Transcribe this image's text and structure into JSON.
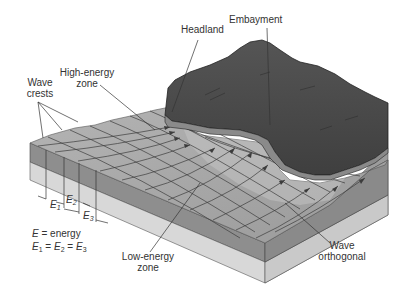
{
  "diagram": {
    "type": "block-diagram",
    "labels": {
      "headland": "Headland",
      "embayment": "Embayment",
      "wave_crests_line1": "Wave",
      "wave_crests_line2": "crests",
      "high_energy_line1": "High-energy",
      "high_energy_line2": "zone",
      "low_energy_line1": "Low-energy",
      "low_energy_line2": "zone",
      "wave_orthogonal_line1": "Wave",
      "wave_orthogonal_line2": "orthogonal"
    },
    "energy_segments": {
      "e1": "E",
      "e1_sub": "1",
      "e2": "E",
      "e2_sub": "2",
      "e3": "E",
      "e3_sub": "3"
    },
    "legend": {
      "line1_var": "E",
      "line1_text": " = energy",
      "line2_a": "E",
      "line2_a_sub": "1",
      "line2_eq1": " = ",
      "line2_b": "E",
      "line2_b_sub": "2",
      "line2_eq2": " = ",
      "line2_c": "E",
      "line2_c_sub": "3"
    },
    "colors": {
      "land": "#4a4a4a",
      "water_surface": "#a8a8a8",
      "block_front": "#8c8c8c",
      "base_layer": "#d6d6d6",
      "right_side": "#9a9a9a",
      "label_text": "#333333"
    }
  }
}
